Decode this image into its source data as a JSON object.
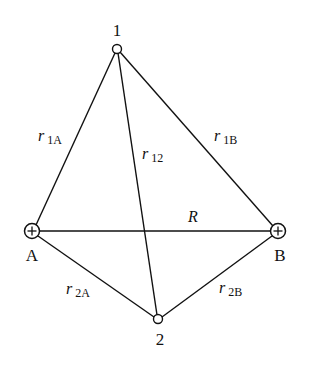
{
  "diagram": {
    "title": "",
    "nodes": {
      "n1": {
        "label": "1",
        "x": 117,
        "y": 49
      },
      "n2": {
        "label": "2",
        "x": 158,
        "y": 319
      },
      "A": {
        "label": "A",
        "x": 32,
        "y": 231,
        "symbol": "+"
      },
      "B": {
        "label": "B",
        "x": 278,
        "y": 231,
        "symbol": "+"
      }
    },
    "edges": {
      "r1A": {
        "main": "r",
        "sub": "1A"
      },
      "r12": {
        "main": "r",
        "sub": "12"
      },
      "r1B": {
        "main": "r",
        "sub": "1B"
      },
      "r2A": {
        "main": "r",
        "sub": "2A"
      },
      "r2B": {
        "main": "r",
        "sub": "2B"
      },
      "R": {
        "main": "R"
      }
    }
  }
}
